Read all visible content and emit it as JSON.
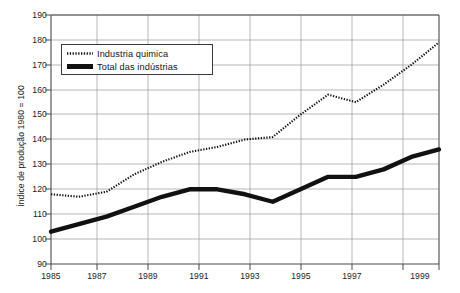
{
  "title": {
    "text": "",
    "note": "cropped-title-fragment"
  },
  "legend": {
    "position": "inside-top-left",
    "items": [
      {
        "label": "Industria quimica",
        "style": "dotted",
        "sample_name": "legend-sample-dotted"
      },
      {
        "label": "Total das indústrias",
        "style": "solid-thick",
        "sample_name": "legend-sample-solid"
      }
    ]
  },
  "axes": {
    "ylabel": "Índice de produção 1980 = 100",
    "xlabel": "",
    "yticks": [
      "90",
      "100",
      "110",
      "120",
      "130",
      "140",
      "150",
      "160",
      "170",
      "180",
      "190"
    ],
    "xticks": [
      "1985",
      "1987",
      "1989",
      "1991",
      "1993",
      "1995",
      "1997",
      "1999"
    ]
  },
  "colors": {
    "line_primary": "#111111",
    "line_secondary": "#2b2b2b",
    "grid": "#9a9a9a",
    "frame": "#555555",
    "background": "#ffffff",
    "text": "#1d1d1d"
  },
  "chart_data": {
    "type": "line",
    "title": "",
    "xlabel": "",
    "ylabel": "Índice de produção 1980 = 100",
    "xlim": [
      1985,
      1999
    ],
    "ylim": [
      90,
      190
    ],
    "ytick_step": 10,
    "xtick_step": 2,
    "grid": true,
    "legend_position": "upper left (inside plot)",
    "x": [
      1985,
      1986,
      1987,
      1988,
      1989,
      1990,
      1991,
      1992,
      1993,
      1994,
      1995,
      1996,
      1997,
      1998,
      1999
    ],
    "series": [
      {
        "name": "Industria quimica",
        "style": "dotted",
        "values": [
          118,
          117,
          119,
          126,
          131,
          135,
          137,
          140,
          141,
          150,
          158,
          155,
          162,
          170,
          179
        ]
      },
      {
        "name": "Total das indústrias",
        "style": "solid-thick",
        "values": [
          103,
          106,
          109,
          113,
          117,
          120,
          120,
          118,
          115,
          120,
          125,
          125,
          128,
          133,
          136
        ]
      }
    ]
  }
}
